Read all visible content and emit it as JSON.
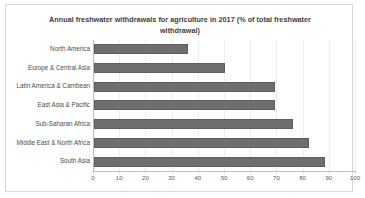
{
  "chart_data": {
    "type": "bar",
    "orientation": "horizontal",
    "title": "Annual freshwater withdrawals for agriculture in 2017 (% of total freshwater withdrawal)",
    "xlabel": "",
    "ylabel": "",
    "xlim": [
      0,
      100
    ],
    "xticks": [
      0,
      10,
      20,
      30,
      40,
      50,
      60,
      70,
      80,
      90,
      100
    ],
    "grid": true,
    "legend": false,
    "bar_color": "#6e6e6e",
    "categories": [
      "North America",
      "Europe & Central Asia",
      "Latin America & Carribean",
      "East Asia & Pacific",
      "Sub-Saharan Africa",
      "Middle East & North Africa",
      "South Asia"
    ],
    "values": [
      36,
      50,
      69,
      69,
      76,
      82,
      88
    ]
  }
}
